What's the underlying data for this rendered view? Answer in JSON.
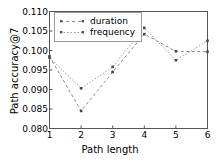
{
  "chart_data": {
    "type": "line",
    "title": "",
    "xlabel": "Path length",
    "ylabel": "Path accuracy@7",
    "x": [
      1,
      2,
      3,
      4,
      5,
      6
    ],
    "xlim": [
      1,
      6
    ],
    "ylim": [
      0.08,
      0.11
    ],
    "xticks": [
      "1",
      "2",
      "3",
      "4",
      "5",
      "6"
    ],
    "yticks": [
      "0.080",
      "0.085",
      "0.090",
      "0.095",
      "0.100",
      "0.105",
      "0.110"
    ],
    "ytick_values": [
      0.08,
      0.085,
      0.09,
      0.095,
      0.1,
      0.105,
      0.11
    ],
    "grid": false,
    "legend_position": "upper left",
    "series": [
      {
        "name": "duration",
        "values": [
          0.0985,
          0.0845,
          0.0945,
          0.1042,
          0.0998,
          0.0997
        ],
        "color": "#888888",
        "linestyle": "dashed",
        "marker": "square"
      },
      {
        "name": "frequency",
        "values": [
          0.0982,
          0.0903,
          0.0958,
          0.1058,
          0.0975,
          0.1025
        ],
        "color": "#999999",
        "linestyle": "dotted",
        "marker": "square"
      }
    ]
  },
  "axes": {
    "spine_color": "#555555"
  }
}
